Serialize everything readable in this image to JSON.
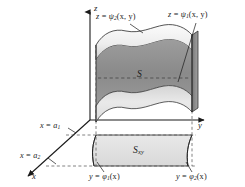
{
  "figure": {
    "kind": "3d-solid-region-diagram",
    "background_color": "#ffffff",
    "line_color": "#1a1a1a",
    "dash_color": "#4a4a4a"
  },
  "axes": {
    "z": {
      "label": "z",
      "direction": "up"
    },
    "y": {
      "label": "y",
      "direction": "right"
    },
    "x": {
      "label": "x",
      "direction": "down-left"
    }
  },
  "labels": {
    "upper_surface": {
      "lhs": "z",
      "eq": "=",
      "fn": "ψ",
      "sub": "2",
      "args": "(x, y)",
      "full": "z = ψ₂(x, y)"
    },
    "lower_surface": {
      "lhs": "z",
      "eq": "=",
      "fn": "ψ",
      "sub": "1",
      "args": "(x, y)",
      "full": "z = ψ₁(x, y)"
    },
    "left_curve": {
      "lhs": "y",
      "eq": "=",
      "fn": "φ",
      "sub": "1",
      "args": "(x)",
      "full": "y = φ₁(x)"
    },
    "right_curve": {
      "lhs": "y",
      "eq": "=",
      "fn": "φ",
      "sub": "2",
      "args": "(x)",
      "full": "y = φ₂(x)"
    },
    "plane_a1": {
      "lhs": "x",
      "eq": "=",
      "fn": "a",
      "sub": "1",
      "args": "",
      "full": "x = a₁"
    },
    "plane_a2": {
      "lhs": "x",
      "eq": "=",
      "fn": "a",
      "sub": "2",
      "args": "",
      "full": "x = a₂"
    },
    "solid_region": {
      "fn": "S",
      "sub": "",
      "full": "S"
    },
    "base_region": {
      "fn": "S",
      "sub": "xy",
      "full": "Sₓᵧ"
    }
  },
  "colors": {
    "surface_top_light": "#f2f2f2",
    "surface_top_mid": "#d8d8d8",
    "surface_band_dark": "#8f8f8f",
    "surface_front_light": "#e6e6e6",
    "side_face": "#b4b4b4",
    "base_fill": "#e2e2e2",
    "base_fill_dark": "#cfcfcf",
    "stroke": "#1a1a1a"
  }
}
